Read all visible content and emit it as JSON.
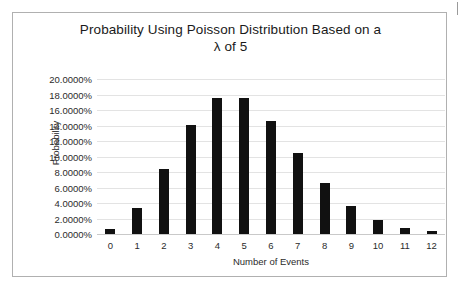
{
  "chart_data": {
    "type": "bar",
    "title": "Probability Using Poisson Distribution Based on a λ of 5",
    "title_line_1": "Probability Using Poisson Distribution Based on a",
    "title_line_2": "λ of 5",
    "xlabel": "Number of Events",
    "ylabel": "Probability",
    "categories": [
      "0",
      "1",
      "2",
      "3",
      "4",
      "5",
      "6",
      "7",
      "8",
      "9",
      "10",
      "11",
      "12"
    ],
    "values": [
      0.6738,
      3.369,
      8.4224,
      14.0374,
      17.5467,
      17.5467,
      14.6223,
      10.4445,
      6.5278,
      3.6266,
      1.8133,
      0.8242,
      0.3434
    ],
    "value_labels": [
      "0.6738%",
      "3.3690%",
      "8.4224%",
      "14.0374%",
      "17.5467%",
      "17.5467%",
      "14.6223%",
      "10.4445%",
      "6.5278%",
      "3.6266%",
      "1.8133%",
      "0.8242%",
      "0.3434%"
    ],
    "ylim": [
      0,
      20
    ],
    "ytick_values": [
      0,
      2,
      4,
      6,
      8,
      10,
      12,
      14,
      16,
      18,
      20
    ],
    "ytick_labels": [
      "0.0000%",
      "2.0000%",
      "4.0000%",
      "6.0000%",
      "8.0000%",
      "10.0000%",
      "12.0000%",
      "14.0000%",
      "16.0000%",
      "18.0000%",
      "20.0000%"
    ],
    "grid": true,
    "legend": false,
    "bar_color": "#111111",
    "grid_color": "#e3e3e3",
    "axis_color": "#c9c9c9",
    "frame_color": "#b0b0b0",
    "background_color": "#ffffff"
  }
}
